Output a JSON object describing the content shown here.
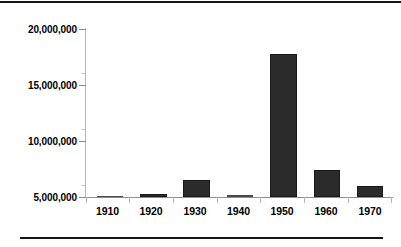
{
  "chart_data": {
    "type": "bar",
    "title": "",
    "subtitle": "",
    "xlabel": "",
    "ylabel": "",
    "categories": [
      "1910",
      "1920",
      "1930",
      "1940",
      "1950",
      "1960",
      "1970"
    ],
    "values": [
      5100000,
      5300000,
      6500000,
      5150000,
      17800000,
      7450000,
      6000000
    ],
    "series": [
      {
        "name": "",
        "values": [
          5100000,
          5300000,
          6500000,
          5150000,
          17800000,
          7450000,
          6000000
        ]
      }
    ],
    "ylim": [
      5000000,
      20000000
    ],
    "y_tick_labels": [
      "5,000,000",
      "10,000,000",
      "15,000,000",
      "20,000,000"
    ],
    "y_tick_values": [
      5000000,
      10000000,
      15000000,
      20000000
    ],
    "y_minor_tick_values": [
      7500000,
      12500000,
      17500000
    ],
    "x_tick_labels": [
      "1910",
      "1920",
      "1930",
      "1940",
      "1950",
      "1960",
      "1970"
    ],
    "grid": false,
    "legend": null,
    "legend_position": "none",
    "annotations": [],
    "bar_color": "#2b2b2b",
    "axis_color": "#8e8e8e",
    "background_color": "#ffffff",
    "rule_color": "#141414"
  },
  "figure": {
    "top_rule": "",
    "bottom_rule": ""
  }
}
